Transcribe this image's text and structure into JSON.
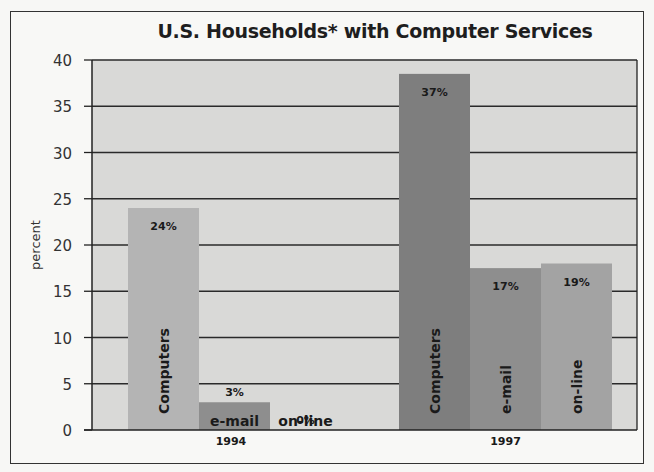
{
  "chart_data": {
    "type": "bar",
    "title": "U.S. Households* with Computer Services",
    "xlabel": "",
    "ylabel": "percent",
    "ylim": [
      0,
      40
    ],
    "yticks": [
      0,
      5,
      10,
      15,
      20,
      25,
      30,
      35,
      40
    ],
    "grid": true,
    "legend": "none",
    "groups": [
      "1994",
      "1997"
    ],
    "series": [
      {
        "name": "Computers",
        "values": [
          24,
          37
        ],
        "labels": [
          "24%",
          "37%"
        ],
        "color": "#a8a8a8"
      },
      {
        "name": "e-mail",
        "values": [
          3,
          17
        ],
        "labels": [
          "3%",
          "17%"
        ],
        "color": "#8c8c8c"
      },
      {
        "name": "on-line",
        "values": [
          0,
          19
        ],
        "labels": [
          "0%",
          "19%"
        ],
        "color": "#9e9e9e"
      }
    ],
    "bar_display_heights": {
      "1994": [
        24,
        3,
        0
      ],
      "1997": [
        38.5,
        17.5,
        18
      ]
    },
    "colors": {
      "1994": [
        "#b4b4b4",
        "#8e8e8e",
        "#c8c8c8"
      ],
      "1997": [
        "#7e7e7e",
        "#8e8e8e",
        "#a3a3a3"
      ],
      "plot_background": "#d9d9d7",
      "grid": "#2a2a2a"
    }
  }
}
